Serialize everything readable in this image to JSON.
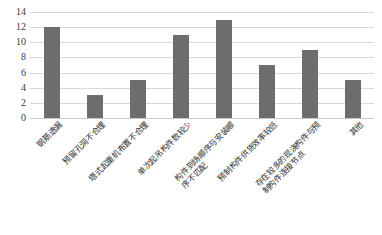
{
  "chart_data": {
    "type": "bar",
    "title": "",
    "subtitle": "",
    "xlabel": "",
    "ylabel": "",
    "ylim": [
      0,
      14
    ],
    "ytick_step": 2,
    "yticks": [
      "14",
      "12",
      "10",
      "8",
      "6",
      "4",
      "2",
      "0"
    ],
    "grid": true,
    "legend": false,
    "legend_position": "none",
    "bar_color": "#6d6d6d",
    "gridline_color": "#d9d9d9",
    "categories": [
      "钢筋遗漏",
      "预留孔洞不合理",
      "塔式起重机布置不合理",
      "单次起吊构件数较少",
      "构件到场顺序与安装顺序不匹配",
      "预制构件供货效率较低",
      "存在较多的现浇构件与预制构件连接节点",
      "其他"
    ],
    "category_lines": [
      [
        "钢筋遗漏"
      ],
      [
        "预留孔洞不合理"
      ],
      [
        "塔式起重机布置不合理"
      ],
      [
        "单次起吊构件数较少"
      ],
      [
        "构件到场顺序与安装顺",
        "序不匹配"
      ],
      [
        "预制构件供货效率较低"
      ],
      [
        "存在较多的现浇构件与预",
        "制构件连接节点"
      ],
      [
        "其他"
      ]
    ],
    "values": [
      12,
      3,
      5,
      11,
      13,
      7,
      9,
      5
    ]
  }
}
